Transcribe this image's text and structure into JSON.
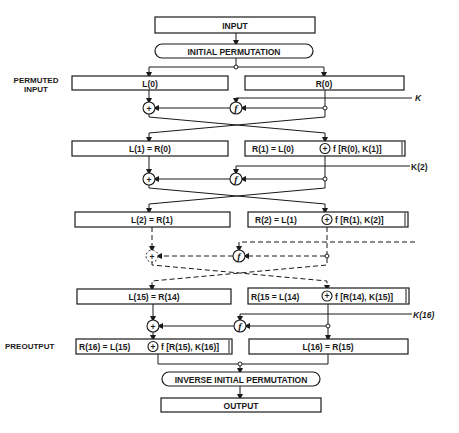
{
  "diagram": {
    "type": "flowchart",
    "blocks": {
      "input": "INPUT",
      "initial_permutation": "INITIAL PERMUTATION",
      "permuted_input_label_1": "PERMUTED",
      "permuted_input_label_2": "INPUT",
      "l0": "L(0)",
      "r0": "R(0)",
      "k1": "K",
      "l1": "L(1) = R(0)",
      "r1_left": "R(1) = L(0)",
      "r1_right": "f [R(0),  K(1)]",
      "k2": "K(2)",
      "l2": "L(2) = R(1)",
      "r2_left": "R(2) = L(1)",
      "r2_right": "f [R(1),  K(2)]",
      "l15": "L(15) = R(14)",
      "r15_left": "R(15 = L(14)",
      "r15_right": "f [R(14),  K(15)]",
      "k16": "K(16)",
      "preoutput_label": "PREOUTPUT",
      "r16_left": "R(16) = L(15)",
      "r16_right": "f [R(15),  K(16)]",
      "l16": "L(16) = R(15)",
      "inverse_initial_permutation": "INVERSE INITIAL PERMUTATION",
      "output": "OUTPUT"
    },
    "symbols": {
      "xor": "+",
      "f": "f"
    }
  }
}
